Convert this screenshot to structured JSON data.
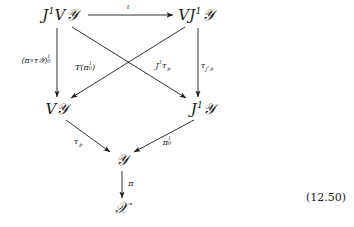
{
  "figure": {
    "kind": "commutative-diagram",
    "equation_number": "(12.50)",
    "background_color": "#ffffff",
    "ink_color": "#1a1a1a"
  },
  "nodes": {
    "jet_vertical_y": {
      "id": "J1VY",
      "text": "J¹V𝒴",
      "base": "J",
      "sup": "1",
      "rest": "V𝒴",
      "x": 60,
      "y": 15
    },
    "vertical_jet_y": {
      "id": "VJ1Y",
      "text": "VJ¹𝒴",
      "base": "VJ",
      "sup": "1",
      "rest": "𝒴",
      "x": 196,
      "y": 15
    },
    "vertical_y": {
      "id": "VY",
      "text": "V𝒴",
      "base": "V",
      "sup": "",
      "rest": "𝒴",
      "x": 57,
      "y": 109
    },
    "jet_y": {
      "id": "J1Y",
      "text": "J¹𝒴",
      "base": "J",
      "sup": "1",
      "rest": "𝒴",
      "x": 203,
      "y": 109
    },
    "y": {
      "id": "Y",
      "text": "𝒴",
      "base": "",
      "sup": "",
      "rest": "𝒴",
      "x": 122,
      "y": 160
    },
    "x": {
      "id": "X",
      "text": "𝒳",
      "base": "",
      "sup": "",
      "rest": "𝒳",
      "x": 122,
      "y": 208
    }
  },
  "arrows": [
    {
      "name": "iota-arrow",
      "from": "J1VY",
      "to": "VJ1Y",
      "label": "ι",
      "label_x": 128,
      "label_y": 7
    },
    {
      "name": "pi-tau-arrow",
      "from": "J1VY",
      "to": "VY",
      "label": "(π∘τ𝒴)¹₀",
      "label_x": 36,
      "label_y": 60
    },
    {
      "name": "j1-tau-arrow",
      "from": "J1VY",
      "to": "J1Y",
      "label": "J¹τ𝒴",
      "label_x": 163,
      "label_y": 66
    },
    {
      "name": "t-pi-arrow",
      "from": "VJ1Y",
      "to": "VY",
      "label": "T(π¹₀)",
      "label_x": 85,
      "label_y": 67
    },
    {
      "name": "tau-j1y-arrow",
      "from": "VJ1Y",
      "to": "J1Y",
      "label": "τJ¹𝒴",
      "label_x": 207,
      "label_y": 66
    },
    {
      "name": "tau-y-arrow",
      "from": "VY",
      "to": "Y",
      "label": "τ𝒴",
      "label_x": 78,
      "label_y": 142
    },
    {
      "name": "pi-1-0-arrow",
      "from": "J1Y",
      "to": "Y",
      "label": "π¹₀",
      "label_x": 167,
      "label_y": 142
    },
    {
      "name": "pi-arrow",
      "from": "Y",
      "to": "X",
      "label": "π",
      "label_x": 131,
      "label_y": 184
    }
  ],
  "labels": {
    "iota": "ι",
    "pi_compose_tau_y_base": "(π∘τ",
    "pi_compose_tau_y_close": ")",
    "t_pi_open": "T(π",
    "t_pi_close": ")",
    "j1_tau_y_base": "J",
    "tau_j1y_base": "τ",
    "tau_y_base": "τ",
    "pi_1_0_base": "π",
    "pi": "π",
    "sup_one": "1",
    "sub_zero": "0",
    "script_y": "𝒴",
    "script_x": "𝒳",
    "letter_v": "V",
    "letter_j": "J",
    "letter_vj": "VJ"
  }
}
